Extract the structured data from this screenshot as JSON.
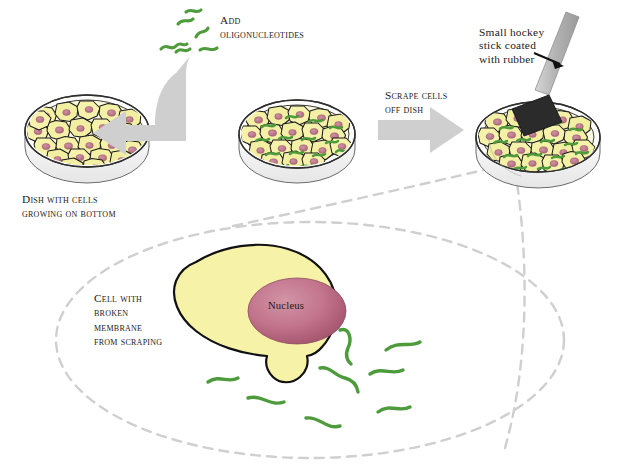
{
  "figure": {
    "type": "scientific-process-diagram",
    "background_color": "#ffffff"
  },
  "palette": {
    "cell_fill": "#f4f0a6",
    "cell_outline": "#1a1a1a",
    "nucleus_fill": "#c2748c",
    "nucleus_dark": "#a8546e",
    "oligo_green": "#4e9b3c",
    "arrow_grey": "#cccccc",
    "dish_outline": "#3b3b3b",
    "dish_glass": "#f2f2f2",
    "callout_dash": "#cfcfcf",
    "blade_black": "#2b2b2b",
    "handle_grey": "#b9b9b9",
    "text": "#1c1a1b"
  },
  "captions": {
    "dish_with_cells": "Dish with cells\ngrowing on bottom",
    "add_oligonucleotides": "Add\noligonucleotides",
    "scrape_cells": "Scrape cells\noff dish",
    "hockey_stick": "Small hockey\nstick coated\nwith rubber",
    "cell_with_broken_membrane": "Cell with\nbroken\nmembrane\nfrom scraping",
    "nucleus": "Nucleus"
  },
  "steps": [
    {
      "id": "step-1",
      "label": "Dish with cells growing on bottom",
      "element": "petri-dish-confluent"
    },
    {
      "id": "step-2",
      "label": "Add oligonucleotides",
      "element": "petri-dish-with-oligos"
    },
    {
      "id": "step-3",
      "label": "Scrape cells off dish",
      "element": "petri-dish-with-scraper"
    },
    {
      "id": "step-4",
      "label": "Cell with broken membrane from scraping",
      "element": "magnified-cell"
    }
  ],
  "icons": {
    "arrow_curved": "curved-arrow-icon",
    "arrow_straight": "right-arrow-icon",
    "pointer_arrow": "pointer-arrow-icon",
    "oligo": "oligonucleotide-squiggle-icon",
    "scraper": "cell-scraper-icon",
    "dish": "petri-dish-icon",
    "nucleus": "nucleus-icon"
  },
  "dishes": {
    "dish1": {
      "cx": 87,
      "cy": 131,
      "rx": 62,
      "ry": 36,
      "oligo_count": 0
    },
    "dish2": {
      "cx": 297,
      "cy": 134,
      "rx": 58,
      "ry": 34,
      "oligo_count": 18
    },
    "dish3": {
      "cx": 538,
      "cy": 137,
      "rx": 62,
      "ry": 37,
      "oligo_count": 22
    }
  },
  "free_oligos": {
    "count": 6,
    "region": "above-curved-arrow"
  },
  "magnified_cell": {
    "outline_color": "#1a1a1a",
    "fill": "#f6f2a7",
    "nucleus_label": "Nucleus",
    "escaping_oligo_count": 8
  }
}
